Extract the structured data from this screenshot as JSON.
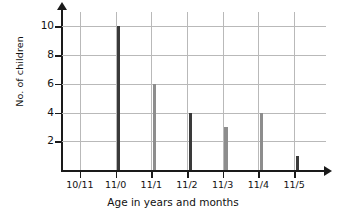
{
  "chart_data": {
    "type": "bar",
    "title": "",
    "xlabel": "Age in years and months",
    "ylabel": "No. of children",
    "categories": [
      "10/11",
      "11/0",
      "11/1",
      "11/2",
      "11/3",
      "11/4",
      "11/5"
    ],
    "values": [
      0,
      10,
      6,
      4,
      3,
      4,
      1
    ],
    "bar_colors": [
      "#3a3a3a",
      "#3a3a3a",
      "#8d8d8d",
      "#3a3a3a",
      "#8d8d8d",
      "#8d8d8d",
      "#3a3a3a"
    ],
    "yticks": [
      2,
      4,
      6,
      8,
      10
    ],
    "ylim": [
      0,
      11
    ],
    "grid": true,
    "legend": "none",
    "axis_color": "#1a1a1a",
    "grid_color": "#b9b9b9"
  }
}
